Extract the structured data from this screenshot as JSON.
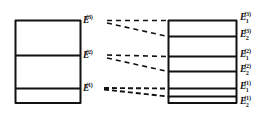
{
  "figure": {
    "ink_color": "#111111",
    "background_color": "#ffffff"
  },
  "left_panel": {
    "name": "unperturbed-levels",
    "box": {
      "x": 15,
      "y": 20,
      "width": 65,
      "height": 83
    },
    "levels": [
      {
        "id": "E3",
        "label_base": "E",
        "sub": "",
        "sup": "(3)",
        "y": 20
      },
      {
        "id": "E2",
        "label_base": "E",
        "sub": "",
        "sup": "(2)",
        "y": 55
      },
      {
        "id": "E1",
        "label_base": "E",
        "sub": "",
        "sup": "(1)",
        "y": 88
      }
    ]
  },
  "right_panel": {
    "name": "split-levels",
    "box": {
      "x": 168,
      "y": 20,
      "width": 69,
      "height": 83
    },
    "levels": [
      {
        "id": "E1_3",
        "label_base": "E",
        "sub": "1",
        "sup": "(3)",
        "y": 20
      },
      {
        "id": "E2_3",
        "label_base": "E",
        "sub": "2",
        "sup": "(3)",
        "y": 36
      },
      {
        "id": "E1_2",
        "label_base": "E",
        "sub": "1",
        "sup": "(2)",
        "y": 56
      },
      {
        "id": "E2_2",
        "label_base": "E",
        "sub": "2",
        "sup": "(2)",
        "y": 71
      },
      {
        "id": "E1_1",
        "label_base": "E",
        "sub": "1",
        "sup": "(1)",
        "y": 88
      },
      {
        "id": "E2_1",
        "label_base": "E",
        "sub": "2",
        "sup": "(1)",
        "y": 96
      }
    ]
  },
  "connectors": [
    {
      "from": "E3",
      "to": "E1_3",
      "x1": 107,
      "y1": 20,
      "x2": 168,
      "y2": 20
    },
    {
      "from": "E3",
      "to": "E2_3",
      "x1": 107,
      "y1": 22,
      "x2": 168,
      "y2": 36
    },
    {
      "from": "E2",
      "to": "E1_2",
      "x1": 107,
      "y1": 55,
      "x2": 168,
      "y2": 56
    },
    {
      "from": "E2",
      "to": "E2_2",
      "x1": 107,
      "y1": 57,
      "x2": 168,
      "y2": 71
    },
    {
      "from": "E1",
      "to": "E1_1",
      "x1": 104,
      "y1": 88,
      "x2": 168,
      "y2": 88
    },
    {
      "from": "E1",
      "to": "E2_1",
      "x1": 104,
      "y1": 89,
      "x2": 168,
      "y2": 96
    }
  ]
}
